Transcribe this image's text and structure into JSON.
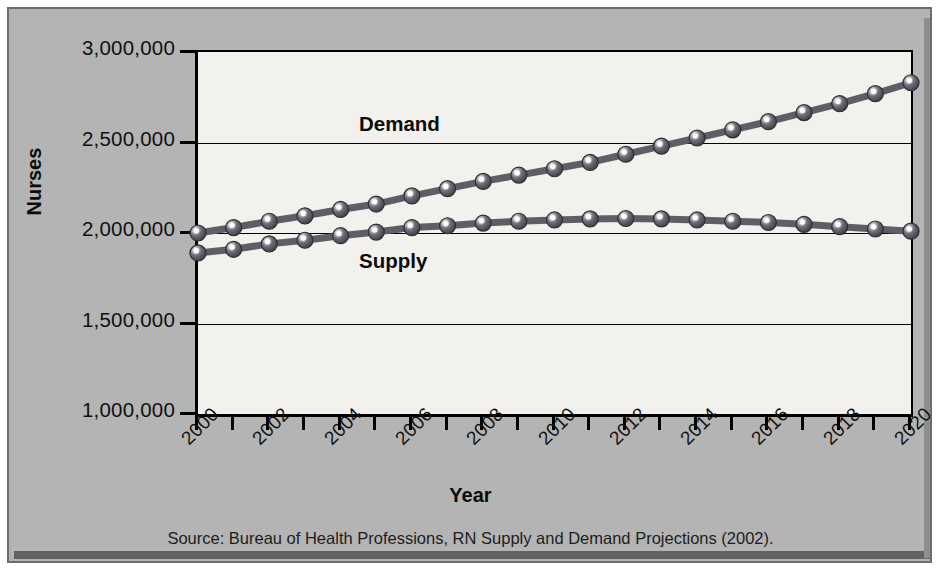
{
  "chart_data": {
    "type": "line",
    "title": "",
    "xlabel": "Year",
    "ylabel": "Nurses",
    "xlim": [
      2000,
      2020
    ],
    "ylim": [
      1000000,
      3000000
    ],
    "grid": true,
    "legend_position": "inline-labels",
    "x": [
      2000,
      2001,
      2002,
      2003,
      2004,
      2005,
      2006,
      2007,
      2008,
      2009,
      2010,
      2011,
      2012,
      2013,
      2014,
      2015,
      2016,
      2017,
      2018,
      2019,
      2020
    ],
    "xtick_labels": [
      "2000",
      "2002",
      "2004",
      "2006",
      "2008",
      "2010",
      "2012",
      "2014",
      "2016",
      "2018",
      "2020"
    ],
    "ytick_labels": [
      "3,000,000",
      "2,500,000",
      "2,000,000",
      "1,500,000",
      "1,000,000"
    ],
    "ytick_values": [
      3000000,
      2500000,
      2000000,
      1500000,
      1000000
    ],
    "series": [
      {
        "name": "Demand",
        "color": "#5e5e66",
        "values": [
          2000000,
          2030000,
          2065000,
          2095000,
          2130000,
          2160000,
          2205000,
          2245000,
          2285000,
          2320000,
          2355000,
          2390000,
          2435000,
          2480000,
          2525000,
          2570000,
          2615000,
          2665000,
          2715000,
          2770000,
          2830000
        ]
      },
      {
        "name": "Supply",
        "color": "#5e5e66",
        "values": [
          1890000,
          1910000,
          1940000,
          1960000,
          1985000,
          2005000,
          2030000,
          2040000,
          2055000,
          2065000,
          2072000,
          2078000,
          2080000,
          2078000,
          2072000,
          2065000,
          2058000,
          2048000,
          2035000,
          2022000,
          2010000
        ]
      }
    ],
    "annotations": [
      {
        "text": "Demand",
        "x": 2004.6,
        "y": 2585000
      },
      {
        "text": "Supply",
        "x": 2004.6,
        "y": 1830000
      }
    ]
  },
  "source_note": "Source: Bureau of Health Professions, RN Supply and Demand Projections (2002).",
  "colors": {
    "plot_background": "#f2f1ee",
    "page_background": "#b4b4b4",
    "axis": "#000000",
    "marker_fill": "#5e5e66",
    "marker_highlight": "#ffffff"
  }
}
